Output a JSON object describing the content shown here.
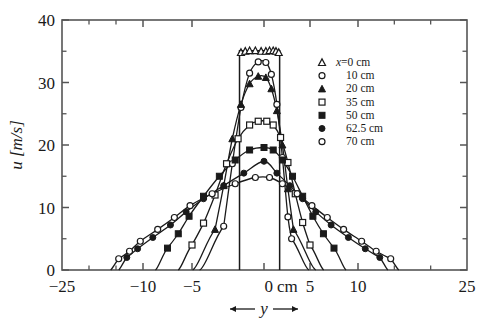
{
  "chart_data": {
    "type": "line",
    "title": "",
    "xlabel": "y",
    "xlabel_unit": "cm",
    "ylabel": "u [m/s]",
    "ylim": [
      0,
      40
    ],
    "xlim": [
      -25,
      25
    ],
    "y_ticks": [
      0,
      10,
      20,
      30,
      40
    ],
    "y_minor_ticks": [
      5,
      15,
      25,
      35
    ],
    "x_ticks": [
      -25,
      -10,
      -5,
      0,
      5,
      10,
      25
    ],
    "x_tick_labels": [
      "-25",
      "-10",
      "-5",
      "0",
      "5",
      "10",
      "25"
    ],
    "x_axis_note": "piecewise-compressed axis: outer decades -25..-10 and 10..25 compressed",
    "zero_tick_suffix": "cm",
    "grid": false,
    "legend_position": "upper right",
    "legend_title_prefix": "x=",
    "series": [
      {
        "name": "x=0 cm",
        "label": "x=0 cm",
        "marker": "open-triangle",
        "x": [
          -1.6,
          -1.3,
          -1.0,
          -0.6,
          -0.2,
          0.2,
          0.6,
          1.0,
          1.3,
          1.6
        ],
        "y": [
          34.8,
          35.0,
          35.1,
          35.1,
          35.0,
          35.0,
          35.1,
          35.1,
          35.0,
          34.8
        ],
        "flat_top": true,
        "edge_drop_x": [
          -1.7,
          1.7
        ],
        "peak": 35.1
      },
      {
        "name": "10 cm",
        "label": "10 cm",
        "marker": "open-circle",
        "x": [
          -2.8,
          -2.2,
          -1.6,
          -1.0,
          -0.4,
          0.2,
          0.8,
          1.4,
          2.0,
          2.6,
          3.0
        ],
        "y": [
          7.0,
          17.0,
          26.0,
          31.5,
          33.3,
          33.2,
          31.3,
          26.5,
          18.0,
          8.5,
          5.0
        ],
        "peak": 33.4
      },
      {
        "name": "20 cm",
        "label": "20 cm",
        "marker": "filled-triangle",
        "x": [
          -3.4,
          -2.8,
          -2.2,
          -1.6,
          -1.0,
          -0.4,
          0.2,
          0.8,
          1.4,
          2.0,
          2.6,
          3.2
        ],
        "y": [
          6.5,
          13.5,
          21.0,
          26.5,
          29.8,
          31.0,
          30.8,
          29.0,
          25.5,
          20.0,
          13.0,
          6.5
        ],
        "peak": 31.1
      },
      {
        "name": "35 cm",
        "label": "35 cm",
        "marker": "open-square",
        "x": [
          -5.0,
          -4.2,
          -3.4,
          -2.6,
          -1.8,
          -1.0,
          -0.4,
          0.3,
          1.0,
          1.8,
          2.6,
          3.4,
          4.2,
          5.0
        ],
        "y": [
          4.0,
          7.5,
          12.0,
          17.0,
          21.0,
          23.2,
          23.8,
          23.8,
          23.2,
          21.2,
          17.2,
          12.2,
          7.6,
          4.0
        ],
        "peak": 23.9
      },
      {
        "name": "50 cm",
        "label": "50 cm",
        "marker": "filled-square",
        "x": [
          -7.5,
          -6.4,
          -5.3,
          -4.2,
          -3.1,
          -2.0,
          -1.0,
          0.0,
          1.0,
          2.0,
          3.1,
          4.2,
          5.3,
          6.4,
          7.5
        ],
        "y": [
          3.5,
          5.8,
          8.6,
          11.8,
          15.0,
          17.6,
          19.2,
          19.6,
          19.2,
          17.6,
          15.0,
          11.8,
          8.6,
          5.8,
          3.5
        ],
        "peak": 19.7
      },
      {
        "name": "62.5 cm",
        "label": "62.5 cm",
        "marker": "filled-circle",
        "x": [
          -13.0,
          -11.0,
          -9.0,
          -7.2,
          -5.6,
          -4.2,
          -2.8,
          -1.4,
          0.0,
          1.4,
          2.8,
          4.2,
          5.6,
          7.2,
          9.0,
          11.0,
          13.0
        ],
        "y": [
          2.0,
          3.4,
          5.2,
          7.2,
          9.3,
          11.4,
          13.5,
          15.5,
          17.4,
          15.5,
          13.5,
          11.4,
          9.3,
          7.2,
          5.2,
          3.4,
          2.0
        ],
        "peak": 17.5
      },
      {
        "name": "70 cm",
        "label": "70 cm",
        "marker": "open-circle",
        "x": [
          -14.5,
          -12.5,
          -10.5,
          -8.5,
          -6.8,
          -5.2,
          -3.6,
          -2.0,
          -0.6,
          0.6,
          2.0,
          3.6,
          5.2,
          6.8,
          8.5,
          10.5,
          12.5,
          14.5
        ],
        "y": [
          1.8,
          3.0,
          4.6,
          6.5,
          8.4,
          10.3,
          12.2,
          13.8,
          14.8,
          14.8,
          13.8,
          12.2,
          10.3,
          8.4,
          6.5,
          4.6,
          3.0,
          1.8
        ],
        "peak": 15.0
      }
    ],
    "legend_entries": [
      {
        "label": "x=0 cm",
        "marker": "open-triangle"
      },
      {
        "label": "10 cm",
        "marker": "open-circle"
      },
      {
        "label": "20 cm",
        "marker": "filled-triangle"
      },
      {
        "label": "35 cm",
        "marker": "open-square"
      },
      {
        "label": "50 cm",
        "marker": "filled-square"
      },
      {
        "label": "62.5 cm",
        "marker": "filled-circle"
      },
      {
        "label": "70 cm",
        "marker": "open-circle"
      }
    ],
    "colors": {
      "line": "#1a1a1a",
      "axis": "#555555",
      "background": "#ffffff"
    }
  }
}
